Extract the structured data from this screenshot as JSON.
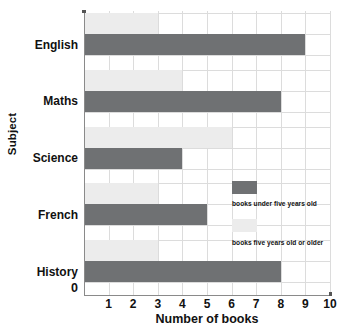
{
  "chart_data": {
    "type": "bar",
    "orientation": "horizontal",
    "title": "",
    "xlabel": "Number of books",
    "ylabel": "Subject",
    "categories": [
      "English",
      "Maths",
      "Science",
      "French",
      "History"
    ],
    "series": [
      {
        "name": "books under five years old",
        "color": "#6f7173",
        "values": [
          9,
          8,
          4,
          5,
          8
        ]
      },
      {
        "name": "books five years old or older",
        "color": "#ececec",
        "values": [
          3,
          4,
          6,
          3,
          3
        ]
      }
    ],
    "xlim": [
      0,
      10
    ],
    "xticks": [
      "0",
      "1",
      "2",
      "3",
      "4",
      "5",
      "6",
      "7",
      "8",
      "9",
      "10"
    ],
    "grid": true,
    "legend_position": "inside-right"
  },
  "axes": {
    "y_title": "Subject",
    "x_title": "Number of books",
    "origin_label": "0"
  },
  "legend": {
    "items": [
      {
        "label": "books under five years old",
        "color": "#6f7173"
      },
      {
        "label": "books five years old or older",
        "color": "#ececec"
      }
    ]
  },
  "colors": {
    "dark_bar": "#6f7173",
    "light_bar": "#ececec",
    "gridline": "#dcdcdc",
    "axis": "#8a8a8a",
    "text": "#111111"
  }
}
